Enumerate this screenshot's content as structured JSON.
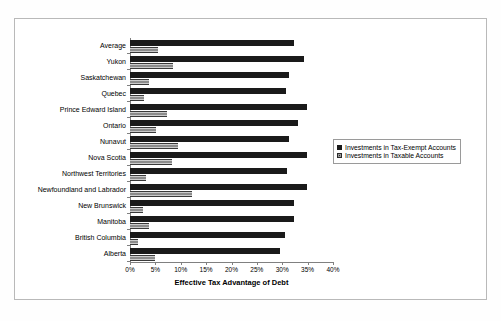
{
  "chart_data": {
    "type": "bar",
    "orientation": "horizontal",
    "title": "",
    "xlabel": "Effective Tax Advantage of Debt",
    "ylabel": "",
    "xlim": [
      0,
      40
    ],
    "xticks": [
      "0%",
      "5%",
      "10%",
      "15%",
      "20%",
      "25%",
      "30%",
      "35%",
      "40%"
    ],
    "xtick_values": [
      0,
      5,
      10,
      15,
      20,
      25,
      30,
      35,
      40
    ],
    "grid": false,
    "legend_position": "right",
    "categories": [
      "Average",
      "Yukon",
      "Saskatchewan",
      "Quebec",
      "Prince Edward Island",
      "Ontario",
      "Nunavut",
      "Nova Scotia",
      "Northwest Territories",
      "Newfoundland and Labrador",
      "New Brunswick",
      "Manitoba",
      "British Columbia",
      "Alberta"
    ],
    "series": [
      {
        "name": "Investments in Tax-Exempt Accounts",
        "color": "#1a1a1a",
        "values": [
          32.3,
          34.3,
          31.4,
          30.8,
          34.9,
          33.2,
          31.4,
          34.9,
          31.0,
          34.9,
          32.4,
          32.4,
          30.6,
          29.5
        ]
      },
      {
        "name": "Investments in Taxable Accounts",
        "color": "#8c8c8c",
        "values": [
          5.6,
          8.5,
          3.8,
          2.8,
          7.3,
          5.2,
          9.5,
          8.3,
          3.2,
          12.2,
          2.6,
          3.8,
          1.5,
          4.9
        ]
      }
    ]
  },
  "legend": {
    "items": [
      {
        "label": "Investments in Tax-Exempt Accounts",
        "swatch": "dark"
      },
      {
        "label": "Investments in Taxable Accounts",
        "swatch": "light"
      }
    ]
  }
}
